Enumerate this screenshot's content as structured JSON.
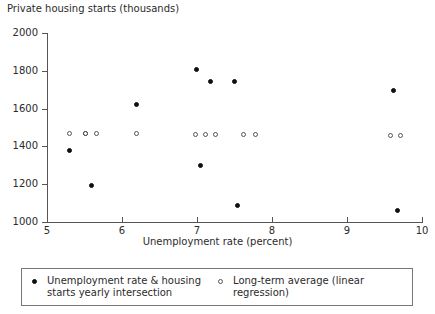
{
  "chart_data": {
    "type": "scatter",
    "title": "",
    "ylabel": "Private housing starts (thousands)",
    "xlabel": "Unemployment rate (percent)",
    "xlim": [
      5,
      10
    ],
    "ylim": [
      1000,
      2000
    ],
    "xticks": [
      5,
      6,
      7,
      8,
      9,
      10
    ],
    "yticks": [
      1000,
      1200,
      1400,
      1600,
      1800,
      2000
    ],
    "xtick_labels": [
      "5",
      "6",
      "7",
      "8",
      "9",
      "10"
    ],
    "ytick_labels": [
      "1000",
      "1200",
      "1400",
      "1600",
      "1800",
      "2000"
    ],
    "grid": false,
    "legend_position": "bottom",
    "series": [
      {
        "name": "Unemployment rate & housing starts yearly intersection",
        "marker": "filled-circle",
        "color": "#111111",
        "points": [
          {
            "x": 5.3,
            "y": 1378
          },
          {
            "x": 5.52,
            "y": 1468
          },
          {
            "x": 5.6,
            "y": 1190
          },
          {
            "x": 6.2,
            "y": 1620
          },
          {
            "x": 7.0,
            "y": 1805
          },
          {
            "x": 7.05,
            "y": 1295
          },
          {
            "x": 7.18,
            "y": 1742
          },
          {
            "x": 7.5,
            "y": 1742
          },
          {
            "x": 7.55,
            "y": 1085
          },
          {
            "x": 9.62,
            "y": 1695
          },
          {
            "x": 9.68,
            "y": 1060
          }
        ]
      },
      {
        "name": "Long-term average (linear regression)",
        "marker": "open-circle",
        "color": "#555555",
        "points": [
          {
            "x": 5.3,
            "y": 1468
          },
          {
            "x": 5.52,
            "y": 1468
          },
          {
            "x": 5.66,
            "y": 1468
          },
          {
            "x": 6.2,
            "y": 1468
          },
          {
            "x": 6.98,
            "y": 1462
          },
          {
            "x": 7.12,
            "y": 1462
          },
          {
            "x": 7.25,
            "y": 1462
          },
          {
            "x": 7.62,
            "y": 1462
          },
          {
            "x": 7.78,
            "y": 1462
          },
          {
            "x": 9.58,
            "y": 1455
          },
          {
            "x": 9.72,
            "y": 1455
          }
        ]
      }
    ]
  },
  "legend": {
    "entries": [
      {
        "marker": "filled-circle",
        "label": "Unemployment rate & housing starts yearly intersection"
      },
      {
        "marker": "open-circle",
        "label": "Long-term average (linear regression)"
      }
    ]
  }
}
